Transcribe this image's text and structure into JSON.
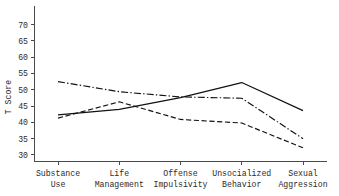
{
  "chart_data": {
    "type": "line",
    "title": "",
    "xlabel": "",
    "ylabel": "T Score",
    "categories": [
      "Substance Use",
      "Life Management",
      "Offense Impulsivity",
      "Unsocialized Behavior",
      "Sexual Aggression"
    ],
    "category_lines": [
      [
        "Substance",
        "Use"
      ],
      [
        "Life",
        "Management"
      ],
      [
        "Offense",
        "Impulsivity"
      ],
      [
        "Unsocialized",
        "Behavior"
      ],
      [
        "Sexual",
        "Aggression"
      ]
    ],
    "ylim": [
      28,
      72
    ],
    "yticks": [
      30,
      35,
      40,
      45,
      50,
      55,
      60,
      65,
      70
    ],
    "ytick_labels": [
      "30",
      "35",
      "40",
      "45",
      "50",
      "55",
      "60",
      "65",
      "70"
    ],
    "grid": false,
    "legend": "none",
    "series": [
      {
        "name": "Group 1",
        "style": "solid",
        "dasharray": "none",
        "color": "#111111",
        "values": [
          42.3,
          44.0,
          47.6,
          52.2,
          43.6
        ]
      },
      {
        "name": "Group 2",
        "style": "dash-dot",
        "dasharray": "7,2.2,1.4,2.2",
        "color": "#111111",
        "values": [
          52.5,
          49.4,
          47.8,
          47.4,
          35.0
        ]
      },
      {
        "name": "Group 3",
        "style": "dashed",
        "dasharray": "5.2,2.6",
        "color": "#111111",
        "values": [
          41.3,
          46.3,
          40.9,
          39.8,
          32.2
        ]
      }
    ]
  },
  "axes": {
    "ylabel": "T Score"
  }
}
